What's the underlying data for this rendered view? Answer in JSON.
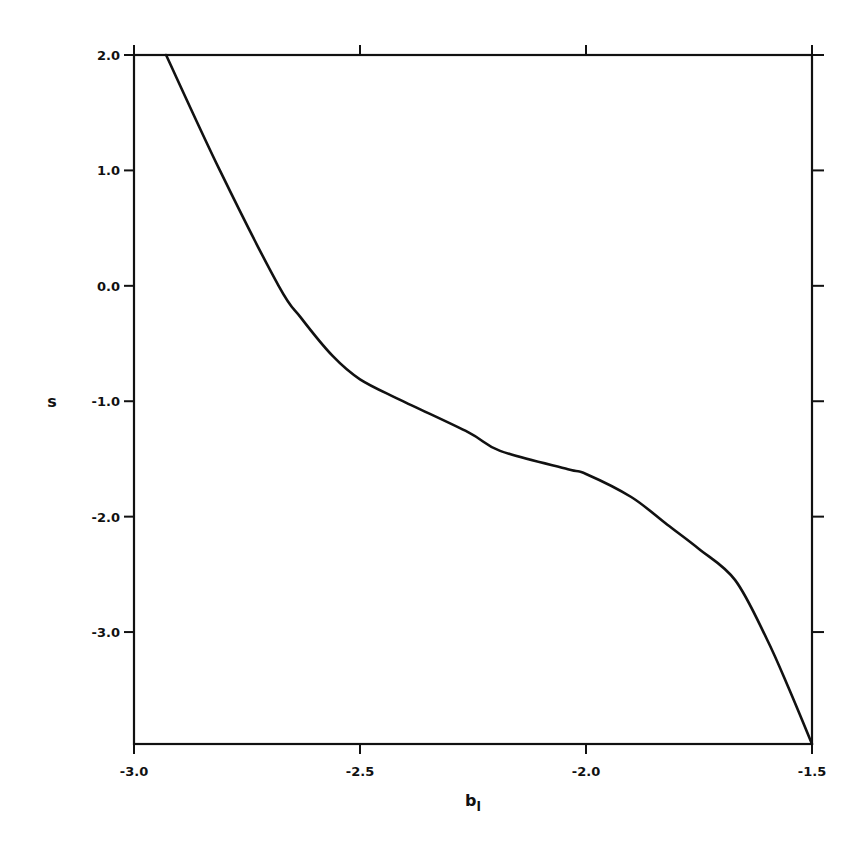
{
  "chart_data": {
    "type": "line",
    "title": "",
    "xlabel": "b_l",
    "xlabel_main": "b",
    "xlabel_sub": "l",
    "ylabel": "s",
    "xlim": [
      -3.0,
      -1.5
    ],
    "ylim": [
      -3.97,
      2.0
    ],
    "grid": false,
    "legend": null,
    "x_ticks": [
      -3.0,
      -2.5,
      -2.0,
      -1.5
    ],
    "x_tick_labels": [
      "-3.0",
      "-2.5",
      "-2.0",
      "-1.5"
    ],
    "y_ticks": [
      2.0,
      1.0,
      0.0,
      -1.0,
      -2.0,
      -3.0
    ],
    "y_tick_labels": [
      "2.0",
      "1.0",
      "0.0",
      "-1.0",
      "-2.0",
      "-3.0"
    ],
    "series": [
      {
        "name": "s(b_l)",
        "color": "#111111",
        "x": [
          -2.929,
          -2.81,
          -2.68,
          -2.63,
          -2.56,
          -2.5,
          -2.41,
          -2.26,
          -2.19,
          -2.04,
          -2.0,
          -1.9,
          -1.82,
          -1.75,
          -1.67,
          -1.6,
          -1.55,
          -1.5
        ],
        "y": [
          2.0,
          1.0,
          0.0,
          -0.28,
          -0.61,
          -0.81,
          -0.99,
          -1.27,
          -1.43,
          -1.59,
          -1.63,
          -1.83,
          -2.07,
          -2.28,
          -2.55,
          -3.06,
          -3.5,
          -3.97
        ]
      }
    ]
  },
  "layout": {
    "plot_left": 134,
    "plot_right": 812,
    "plot_top": 55,
    "plot_bottom": 744
  }
}
